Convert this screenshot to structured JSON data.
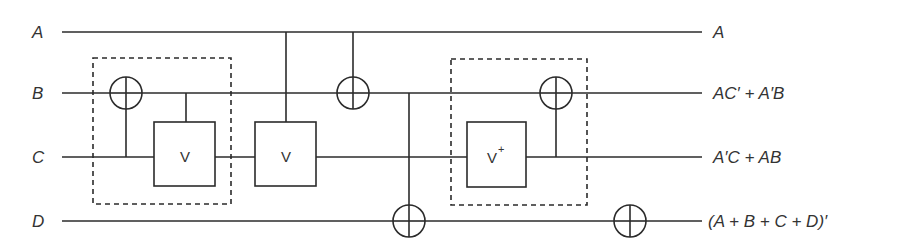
{
  "diagram": {
    "type": "quantum-reversible-circuit",
    "inputs": [
      {
        "label": "A",
        "y": 32
      },
      {
        "label": "B",
        "y": 93
      },
      {
        "label": "C",
        "y": 157
      },
      {
        "label": "D",
        "y": 221
      }
    ],
    "outputs": [
      {
        "label": "A",
        "y": 32
      },
      {
        "label": "AC′ + A′B",
        "y": 93
      },
      {
        "label": "A′C + AB",
        "y": 157
      },
      {
        "label": "(A + B + C + D)′",
        "y": 221
      }
    ],
    "gates": [
      {
        "type": "cnot",
        "control": "C",
        "target": "B",
        "x": 126
      },
      {
        "type": "controlled-v",
        "label": "V",
        "control": "B",
        "target": "C",
        "x": 185
      },
      {
        "type": "controlled-v",
        "label": "V",
        "control": "A",
        "target": "C",
        "x": 286
      },
      {
        "type": "cnot",
        "control": "A",
        "target": "B",
        "x": 353
      },
      {
        "type": "cnot",
        "control": "B",
        "target": "D",
        "x": 409
      },
      {
        "type": "controlled-v-dagger",
        "label": "V",
        "superscript": "+",
        "control": "C",
        "target": "C",
        "x": 496
      },
      {
        "type": "cnot",
        "control": "C",
        "target": "B",
        "x": 556
      },
      {
        "type": "not",
        "target": "D",
        "x": 630
      }
    ],
    "groups": [
      {
        "name": "dashed-group-1",
        "contains": [
          "cnot C→B",
          "controlled-V B→C"
        ]
      },
      {
        "name": "dashed-group-2",
        "contains": [
          "V+",
          "cnot C→B"
        ]
      }
    ],
    "gate_labels": {
      "v1": "V",
      "v2": "V",
      "vdag": "V",
      "vdag_sup": "+"
    }
  }
}
